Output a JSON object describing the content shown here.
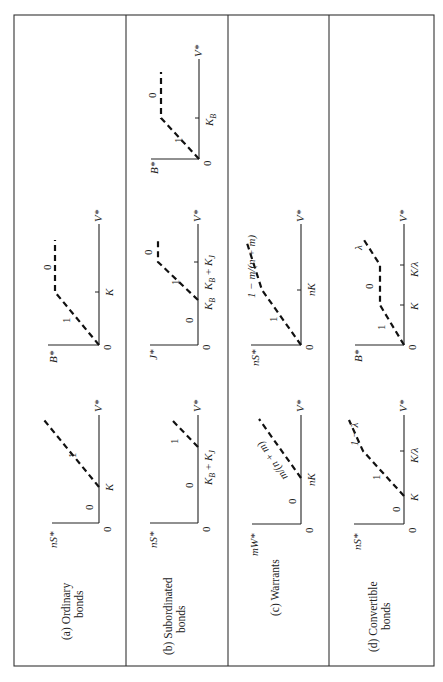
{
  "figure": {
    "orientation": "rotated 90 degrees counter-clockwise",
    "rows": [
      {
        "id": "a",
        "label_line1": "(a)  Ordinary",
        "label_line2": "bonds",
        "panels": [
          {
            "y_axis": "nS*",
            "x_axis": "V*",
            "origin": "0",
            "ticks": [
              "K"
            ],
            "slopes": [
              "0",
              "1"
            ]
          },
          {
            "y_axis": "B*",
            "x_axis": "V*",
            "origin": "0",
            "ticks": [
              "K"
            ],
            "slopes": [
              "1",
              "0"
            ]
          }
        ]
      },
      {
        "id": "b",
        "label_line1": "(b)  Subordinated",
        "label_line2": "bonds",
        "panels": [
          {
            "y_axis": "nS*",
            "x_axis": "V*",
            "origin": "0",
            "ticks": [
              "K_B + K_J"
            ],
            "slopes": [
              "0",
              "1"
            ]
          },
          {
            "y_axis": "J*",
            "x_axis": "V*",
            "origin": "0",
            "ticks": [
              "K_B",
              "K_B + K_J"
            ],
            "slopes": [
              "0",
              "1",
              "0"
            ]
          },
          {
            "y_axis": "B*",
            "x_axis": "V*",
            "origin": "0",
            "ticks": [
              "K_B"
            ],
            "slopes": [
              "1",
              "0"
            ]
          }
        ]
      },
      {
        "id": "c",
        "label_line1": "(c)  Warrants",
        "label_line2": "",
        "panels": [
          {
            "y_axis": "mW*",
            "x_axis": "V*",
            "origin": "0",
            "ticks": [
              "nK"
            ],
            "slopes": [
              "0",
              "m/(n + m)"
            ]
          },
          {
            "y_axis": "nS*",
            "x_axis": "V*",
            "origin": "0",
            "ticks": [
              "nK"
            ],
            "slopes": [
              "1",
              "1 − m/(n + m)"
            ]
          }
        ]
      },
      {
        "id": "d",
        "label_line1": "(d)  Convertible",
        "label_line2": "bonds",
        "panels": [
          {
            "y_axis": "nS*",
            "x_axis": "V*",
            "origin": "0",
            "ticks": [
              "K",
              "K/λ"
            ],
            "slopes": [
              "0",
              "1",
              "1 − λ"
            ]
          },
          {
            "y_axis": "B*",
            "x_axis": "V*",
            "origin": "0",
            "ticks": [
              "K",
              "K/λ"
            ],
            "slopes": [
              "1",
              "0",
              "λ"
            ]
          }
        ]
      }
    ]
  },
  "text": {
    "a_label1": "(a)  Ordinary",
    "a_label2": "bonds",
    "b_label1": "(b)  Subordinated",
    "b_label2": "bonds",
    "c_label1": "(c)  Warrants",
    "d_label1": "(d)  Convertible",
    "d_label2": "bonds",
    "nS": "nS*",
    "B": "B*",
    "J": "J*",
    "mW": "mW*",
    "V": "V*",
    "zero": "0",
    "one": "1",
    "K": "K",
    "KB": "K",
    "KB_sub": "B",
    "KJ_sub": "J",
    "plus": " + ",
    "nK": "nK",
    "Klam": "K/λ",
    "mnm": "m/(n + m)",
    "one_mnm": "1 − m/(n + m)",
    "one_lam": "1 − λ",
    "lam": "λ"
  }
}
